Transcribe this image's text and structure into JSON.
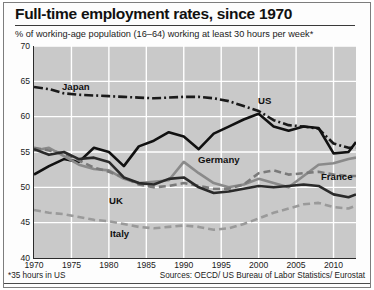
{
  "header": {
    "title": "Full-time employment rates, since 1970",
    "subtitle": "% of working-age population (16–64) working at least 30 hours per week*"
  },
  "footer": {
    "footnote": "*35 hours in US",
    "sources": "Sources: OECD/ US Bureau of Labor Statistics/ Eurostat"
  },
  "chart_data": {
    "type": "line",
    "title": "Full-time employment rates, since 1970",
    "subtitle": "% of working-age population (16–64) working at least 30 hours per week*",
    "xlabel": "",
    "ylabel": "% of working-age population",
    "xlim": [
      1970,
      2013
    ],
    "ylim": [
      40,
      70
    ],
    "yticks": [
      40,
      45,
      50,
      55,
      60,
      65,
      70
    ],
    "xticks": [
      1970,
      1975,
      1980,
      1985,
      1990,
      1995,
      2000,
      2005,
      2010
    ],
    "grid": true,
    "legend": "inline-labels",
    "plot_background": "#c9c9c9",
    "gridline_color": "#ffffff",
    "series": [
      {
        "name": "Japan",
        "style": "dash-dot",
        "color": "#1a1a1a",
        "label_position": {
          "x": 62,
          "y": 82
        },
        "x": [
          1970,
          1972,
          1974,
          1976,
          1978,
          1980,
          1982,
          1984,
          1986,
          1988,
          1990,
          1992,
          1994,
          1996,
          1998,
          2000,
          2002,
          2004,
          2006,
          2008,
          2010,
          2012,
          2013
        ],
        "values": [
          64.2,
          63.9,
          63.3,
          63.1,
          63.0,
          62.9,
          62.8,
          62.7,
          62.6,
          62.7,
          62.8,
          62.8,
          62.6,
          62.2,
          61.5,
          60.8,
          59.5,
          58.8,
          58.6,
          58.3,
          56.2,
          55.6,
          55.6
        ]
      },
      {
        "name": "US",
        "style": "solid",
        "color": "#111111",
        "label_position": {
          "x": 258,
          "y": 96
        },
        "x": [
          1970,
          1972,
          1974,
          1976,
          1978,
          1980,
          1982,
          1984,
          1986,
          1988,
          1990,
          1992,
          1994,
          1996,
          1998,
          2000,
          2002,
          2004,
          2006,
          2008,
          2010,
          2012,
          2013
        ],
        "values": [
          51.8,
          53.0,
          54.0,
          53.6,
          55.6,
          55.0,
          53.0,
          55.8,
          56.6,
          57.8,
          57.2,
          55.4,
          57.6,
          58.6,
          59.6,
          60.4,
          58.6,
          58.0,
          58.6,
          58.4,
          54.8,
          55.0,
          56.4
        ]
      },
      {
        "name": "Germany",
        "style": "solid",
        "color": "#8a8a8a",
        "label_position": {
          "x": 198,
          "y": 155
        },
        "x": [
          1970,
          1972,
          1974,
          1976,
          1978,
          1980,
          1982,
          1984,
          1986,
          1988,
          1990,
          1992,
          1994,
          1996,
          1998,
          2000,
          2002,
          2004,
          2006,
          2008,
          2010,
          2012,
          2013
        ],
        "values": [
          55.2,
          55.6,
          54.4,
          53.2,
          52.6,
          52.4,
          51.2,
          50.6,
          50.8,
          51.0,
          53.6,
          52.0,
          50.6,
          50.0,
          50.4,
          51.2,
          50.6,
          50.0,
          51.6,
          53.2,
          53.4,
          54.0,
          54.2
        ]
      },
      {
        "name": "France",
        "style": "dashed",
        "color": "#7a7a7a",
        "label_position": {
          "x": 321,
          "y": 172
        },
        "x": [
          1970,
          1972,
          1974,
          1976,
          1978,
          1980,
          1982,
          1984,
          1986,
          1988,
          1990,
          1992,
          1994,
          1996,
          1998,
          2000,
          2002,
          2004,
          2006,
          2008,
          2010,
          2012,
          2013
        ],
        "values": [
          55.6,
          55.2,
          54.8,
          53.8,
          52.8,
          52.2,
          51.4,
          50.4,
          50.0,
          50.2,
          50.6,
          50.2,
          49.8,
          49.8,
          50.4,
          52.0,
          52.4,
          51.8,
          52.0,
          52.2,
          51.8,
          51.6,
          51.6
        ]
      },
      {
        "name": "UK",
        "style": "solid",
        "color": "#2a2a2a",
        "label_position": {
          "x": 109,
          "y": 196
        },
        "x": [
          1970,
          1972,
          1974,
          1976,
          1978,
          1980,
          1982,
          1984,
          1986,
          1988,
          1990,
          1992,
          1994,
          1996,
          1998,
          2000,
          2002,
          2004,
          2006,
          2008,
          2010,
          2012,
          2013
        ],
        "values": [
          55.4,
          54.6,
          55.0,
          54.0,
          54.2,
          53.6,
          51.4,
          50.6,
          50.4,
          51.2,
          51.4,
          50.0,
          49.2,
          49.4,
          49.8,
          50.2,
          50.0,
          50.2,
          50.4,
          50.2,
          49.0,
          48.6,
          49.0
        ]
      },
      {
        "name": "Italy",
        "style": "dashed",
        "color": "#9a9a9a",
        "label_position": {
          "x": 110,
          "y": 229
        },
        "x": [
          1970,
          1972,
          1974,
          1976,
          1978,
          1980,
          1982,
          1984,
          1986,
          1988,
          1990,
          1992,
          1994,
          1996,
          1998,
          2000,
          2002,
          2004,
          2006,
          2008,
          2010,
          2012,
          2013
        ],
        "values": [
          46.8,
          46.4,
          46.2,
          45.8,
          45.4,
          45.2,
          44.8,
          44.4,
          44.2,
          44.4,
          44.6,
          44.4,
          44.0,
          44.2,
          44.8,
          45.6,
          46.4,
          47.0,
          47.6,
          47.8,
          47.2,
          47.0,
          47.4
        ]
      }
    ]
  }
}
